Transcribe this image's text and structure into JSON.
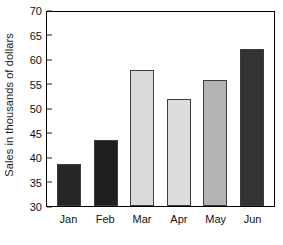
{
  "chart_data": {
    "type": "bar",
    "title": "",
    "xlabel": "",
    "ylabel": "Sales in thousands of dollars",
    "categories": [
      "Jan",
      "Feb",
      "Mar",
      "Apr",
      "May",
      "Jun"
    ],
    "values": [
      38.8,
      43.6,
      58.2,
      52.1,
      56.1,
      62.5
    ],
    "ylim": [
      30,
      70
    ],
    "yticks": [
      30,
      35,
      40,
      45,
      50,
      55,
      60,
      65,
      70
    ],
    "ytick_labels": [
      "30",
      "35",
      "40",
      "45",
      "50",
      "55",
      "60",
      "65",
      "70"
    ],
    "grid": false,
    "legend": false,
    "bar_colors": [
      "#262626",
      "#1f1f1f",
      "#d9d9d9",
      "#dddddd",
      "#b3b3b3",
      "#333333"
    ],
    "bar_edge_color": "#3d3d3d",
    "frame_color": "#000000",
    "background_color": "#ffffff"
  }
}
